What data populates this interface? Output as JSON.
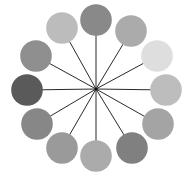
{
  "diagram": {
    "title": "",
    "background": "#ffffff",
    "hub": {
      "x": 96,
      "y": 89,
      "color": "#111111",
      "radius": 1.6
    },
    "spoke_color": "#2a2a2a",
    "spoke_width": 1,
    "circle_radius": 15.8,
    "circles": [
      {
        "position": "12 o'clock",
        "x": 96,
        "y": 20,
        "fill": "#898989"
      },
      {
        "position": "1 o'clock",
        "x": 131,
        "y": 31,
        "fill": "#ababab"
      },
      {
        "position": "2 o'clock",
        "x": 157,
        "y": 56,
        "fill": "#dedede"
      },
      {
        "position": "3 o'clock",
        "x": 166,
        "y": 90,
        "fill": "#bdbdbd"
      },
      {
        "position": "4 o'clock",
        "x": 158,
        "y": 124,
        "fill": "#a4a4a4"
      },
      {
        "position": "5 o'clock",
        "x": 132,
        "y": 148,
        "fill": "#808080"
      },
      {
        "position": "6 o'clock",
        "x": 96,
        "y": 156,
        "fill": "#ababab"
      },
      {
        "position": "7 o'clock",
        "x": 62,
        "y": 148,
        "fill": "#9a9a9a"
      },
      {
        "position": "8 o'clock",
        "x": 37,
        "y": 124,
        "fill": "#878787"
      },
      {
        "position": "9 o'clock",
        "x": 27,
        "y": 90,
        "fill": "#5a5a5a"
      },
      {
        "position": "10 o'clock",
        "x": 36,
        "y": 56,
        "fill": "#8f8f8f"
      },
      {
        "position": "11 o'clock",
        "x": 62,
        "y": 28,
        "fill": "#bcbcbc"
      }
    ]
  }
}
